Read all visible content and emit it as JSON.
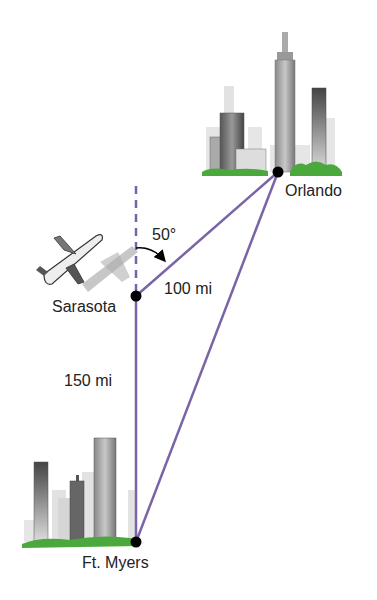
{
  "diagram": {
    "cities": [
      {
        "name": "Orlando",
        "x": 278,
        "y": 172
      },
      {
        "name": "Sarasota",
        "x": 136,
        "y": 296
      },
      {
        "name": "Ft. Myers",
        "x": 136,
        "y": 542
      }
    ],
    "segments": [
      {
        "from": "Sarasota",
        "to": "Orlando",
        "label": "100 mi"
      },
      {
        "from": "Sarasota",
        "to": "Ft. Myers",
        "label": "150 mi"
      },
      {
        "from": "Ft. Myers",
        "to": "Orlando",
        "label": ""
      }
    ],
    "angle": {
      "label": "50°",
      "between": "north dashed line and Sarasota–Orlando segment"
    },
    "colors": {
      "line": "#7a63a6",
      "dashed": "#7a63a6",
      "point": "#000000",
      "grass": "#4aa83c"
    }
  },
  "labels": {
    "orlando": "Orlando",
    "sarasota": "Sarasota",
    "ft_myers": "Ft. Myers",
    "dist_sarasota_orlando": "100 mi",
    "dist_sarasota_ftmyers": "150 mi",
    "angle": "50°"
  }
}
